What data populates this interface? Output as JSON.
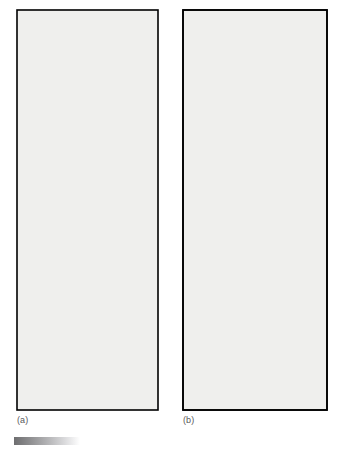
{
  "figure": {
    "caption_a": "(a)",
    "caption_b": "(b)",
    "frame_color": "#000000",
    "panel_background": "#efefed",
    "page_background": "#ffffff",
    "line_color": "#000000",
    "node_fill": "#ffffff",
    "marker_fill": "#111111",
    "gradient_bar": {
      "name": "gradient-bar",
      "from": "#6e6e70",
      "to": "#ffffff"
    }
  },
  "panel_a": {
    "name": "panel-a",
    "frame": {
      "x": 17,
      "y": 10,
      "width": 141,
      "height": 400
    },
    "line_width": 1.4,
    "node_radius": 3.1,
    "nodes": [
      {
        "id": "n1",
        "x": 35,
        "y": 20
      },
      {
        "id": "n2",
        "x": 88,
        "y": 82
      },
      {
        "id": "n3",
        "x": 143,
        "y": 71
      },
      {
        "id": "n4",
        "x": 126,
        "y": 16
      },
      {
        "id": "n5",
        "x": 53,
        "y": 90
      },
      {
        "id": "n6",
        "x": 31,
        "y": 106
      },
      {
        "id": "n7",
        "x": 111,
        "y": 154
      },
      {
        "id": "n8",
        "x": 49,
        "y": 166
      },
      {
        "id": "n9",
        "x": 139,
        "y": 148
      },
      {
        "id": "n10",
        "x": 160,
        "y": 160
      },
      {
        "id": "n11",
        "x": 95,
        "y": 178
      },
      {
        "id": "n12",
        "x": 134,
        "y": 174
      },
      {
        "id": "n13",
        "x": 122,
        "y": 199
      },
      {
        "id": "n14",
        "x": 89,
        "y": 220
      },
      {
        "id": "n15",
        "x": 150,
        "y": 226
      },
      {
        "id": "n16",
        "x": 59,
        "y": 237
      },
      {
        "id": "n17",
        "x": 107,
        "y": 262
      },
      {
        "id": "n18",
        "x": 25,
        "y": 288
      },
      {
        "id": "n19",
        "x": 108,
        "y": 292
      },
      {
        "id": "n20",
        "x": 86,
        "y": 316
      },
      {
        "id": "n21",
        "x": 121,
        "y": 318
      },
      {
        "id": "n22",
        "x": 148,
        "y": 316
      }
    ],
    "edges": [
      [
        "n1",
        "n2"
      ],
      [
        "n2",
        "n3"
      ],
      [
        "n3",
        "n4"
      ],
      [
        "n5",
        "n6"
      ],
      [
        "n6",
        "n7"
      ],
      [
        "n7",
        "n8"
      ],
      [
        "n7",
        "n9"
      ],
      [
        "n9",
        "n10"
      ],
      [
        "n10",
        "n11"
      ],
      [
        "n11",
        "n12"
      ],
      [
        "n12",
        "n10"
      ],
      [
        "n11",
        "n13"
      ],
      [
        "n13",
        "n14"
      ],
      [
        "n14",
        "n15"
      ],
      [
        "n14",
        "n16"
      ],
      [
        "n16",
        "n17"
      ],
      [
        "n17",
        "n18"
      ],
      [
        "n17",
        "n19"
      ],
      [
        "n18",
        "n20"
      ],
      [
        "n20",
        "X"
      ],
      [
        "n19",
        "n21"
      ],
      [
        "n21",
        "n22"
      ],
      [
        "n22",
        "A"
      ]
    ],
    "markers": [
      {
        "id": "X",
        "label": "X",
        "x": 75,
        "y": 345,
        "label_x": 76,
        "label_y": 360
      },
      {
        "id": "A",
        "label": "A",
        "x": 112,
        "y": 387,
        "label_x": 120,
        "label_y": 397
      }
    ],
    "marker_radius": 4.2
  },
  "panel_b": {
    "name": "panel-b",
    "frame": {
      "x": 183,
      "y": 10,
      "width": 144,
      "height": 400
    },
    "node_radius": 3.4,
    "thick_width": 4.6,
    "thin_width": 1.7,
    "nodes": [
      {
        "id": "b1",
        "x": 207,
        "y": 61
      },
      {
        "id": "b2",
        "x": 290,
        "y": 43
      },
      {
        "id": "b3",
        "x": 238,
        "y": 100
      },
      {
        "id": "b4",
        "x": 275,
        "y": 172
      },
      {
        "id": "b5",
        "x": 221,
        "y": 180
      },
      {
        "id": "b6",
        "x": 243,
        "y": 212
      },
      {
        "id": "b7",
        "x": 199,
        "y": 301
      },
      {
        "id": "b8",
        "x": 232,
        "y": 352
      },
      {
        "id": "b9",
        "x": 310,
        "y": 334
      }
    ],
    "boundary_points": [
      {
        "id": "t1",
        "x": 207,
        "y": 10
      },
      {
        "id": "t2",
        "x": 290,
        "y": 10
      },
      {
        "id": "l1",
        "x": 183,
        "y": 61
      },
      {
        "id": "r1",
        "x": 327,
        "y": 78
      },
      {
        "id": "l2",
        "x": 183,
        "y": 180
      },
      {
        "id": "r2",
        "x": 327,
        "y": 194
      },
      {
        "id": "l3",
        "x": 183,
        "y": 316
      },
      {
        "id": "bb1",
        "x": 199,
        "y": 410
      },
      {
        "id": "bb2",
        "x": 232,
        "y": 410
      },
      {
        "id": "bb3",
        "x": 310,
        "y": 410
      }
    ],
    "edges_thick": [
      [
        "t1",
        "b1"
      ],
      [
        "t2",
        "b2"
      ],
      [
        "b1",
        "b5"
      ],
      [
        "b2",
        "b4"
      ],
      [
        "b4",
        "b6"
      ],
      [
        "b5",
        "b7"
      ],
      [
        "b6",
        "b8"
      ],
      [
        "b7",
        "bb1"
      ],
      [
        "b8",
        "bb2"
      ],
      [
        "b9",
        "bb3"
      ],
      [
        "b8",
        "b9"
      ]
    ],
    "edges_thin": [
      [
        "l1",
        "b1"
      ],
      [
        "b1",
        "b2"
      ],
      [
        "b1",
        "b3"
      ],
      [
        "b3",
        "b2"
      ],
      [
        "b3",
        "b4"
      ],
      [
        "b2",
        "r1"
      ],
      [
        "l2",
        "b5"
      ],
      [
        "b5",
        "b6"
      ],
      [
        "b4",
        "b6"
      ],
      [
        "b4",
        "r2"
      ],
      [
        "b4",
        "b8"
      ],
      [
        "b6",
        "b7"
      ],
      [
        "b6",
        "b9"
      ],
      [
        "l3",
        "b7"
      ],
      [
        "b7",
        "b8"
      ]
    ]
  }
}
